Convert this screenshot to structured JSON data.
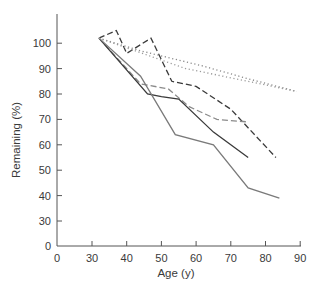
{
  "chart_data": {
    "type": "line",
    "title": "",
    "xlabel": "Age (y)",
    "ylabel": "Remaining (%)",
    "x_ticks": [
      "0",
      "30",
      "40",
      "50",
      "60",
      "70",
      "80",
      "90"
    ],
    "y_ticks": [
      "0",
      "30",
      "40",
      "50",
      "60",
      "70",
      "80",
      "90",
      "100"
    ],
    "xlim": [
      0,
      90
    ],
    "ylim": [
      0,
      110
    ],
    "axis_breaks": {
      "x": "0 to 30 compressed",
      "y": "0 to 30 compressed"
    },
    "grid": false,
    "legend": null,
    "series": [
      {
        "name": "dark dashed",
        "style": "dashed",
        "color": "#3a3a3a",
        "x": [
          32,
          37,
          40,
          47,
          53,
          60,
          70,
          83
        ],
        "y": [
          102,
          105,
          96,
          102,
          85,
          83,
          74,
          55
        ]
      },
      {
        "name": "gray dashed",
        "style": "dashed",
        "color": "#8a8a8a",
        "x": [
          32,
          44,
          52,
          58,
          66,
          75
        ],
        "y": [
          102,
          84,
          82,
          75,
          70,
          69
        ]
      },
      {
        "name": "dark solid",
        "style": "solid",
        "color": "#3a3a3a",
        "x": [
          32,
          46,
          50,
          55,
          65,
          75
        ],
        "y": [
          102,
          80,
          79,
          78,
          65,
          55
        ]
      },
      {
        "name": "gray solid",
        "style": "solid",
        "color": "#7a7a7a",
        "x": [
          32,
          44,
          54,
          65,
          75,
          84
        ],
        "y": [
          102,
          87,
          64,
          60,
          43,
          39
        ]
      },
      {
        "name": "dotted upper",
        "style": "dotted",
        "color": "#8a8a8a",
        "x": [
          32,
          44,
          62,
          75,
          89
        ],
        "y": [
          102,
          97,
          91,
          86,
          81
        ]
      },
      {
        "name": "dotted lower",
        "style": "dotted",
        "color": "#9a9a9a",
        "x": [
          32,
          57,
          75,
          89
        ],
        "y": [
          102,
          90,
          85,
          81
        ]
      }
    ]
  }
}
